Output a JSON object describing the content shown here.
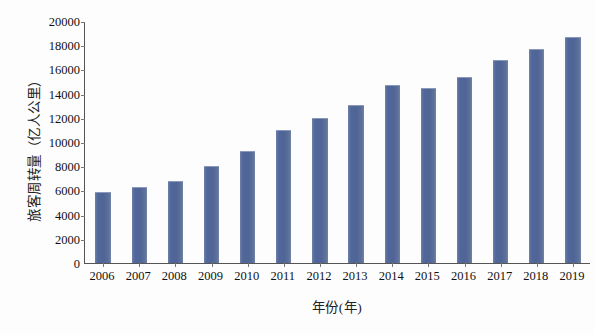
{
  "chart_data": {
    "type": "bar",
    "title": "",
    "xlabel": "年份(年)",
    "ylabel": "旅客周转量（亿人公里）",
    "categories": [
      "2006",
      "2007",
      "2008",
      "2009",
      "2010",
      "2011",
      "2012",
      "2013",
      "2014",
      "2015",
      "2016",
      "2017",
      "2018",
      "2019"
    ],
    "values": [
      5800,
      6200,
      6700,
      7900,
      9200,
      10900,
      11900,
      13000,
      14600,
      14400,
      15300,
      16700,
      17600,
      18600
    ],
    "ylim": [
      0,
      20000
    ],
    "yticks": [
      0,
      2000,
      4000,
      6000,
      8000,
      10000,
      12000,
      14000,
      16000,
      18000,
      20000
    ],
    "ytick_labels": [
      "0",
      "2000",
      "4000",
      "6000",
      "8000",
      "10000",
      "12000",
      "14000",
      "16000",
      "18000",
      "20000"
    ],
    "grid": false,
    "legend": "none",
    "series": [
      {
        "name": "旅客周转量",
        "color": "#51679a",
        "values": [
          5800,
          6200,
          6700,
          7900,
          9200,
          10900,
          11900,
          13000,
          14600,
          14400,
          15300,
          16700,
          17600,
          18600
        ]
      }
    ],
    "colors": {
      "bar": "#51679a",
      "bar_highlight": "#7083a8",
      "axis": "#555555",
      "text": "#111111",
      "background": "#fdfdfd"
    }
  }
}
